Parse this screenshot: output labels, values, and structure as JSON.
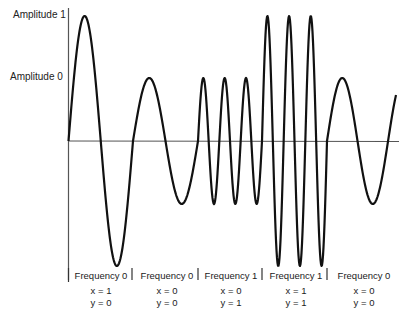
{
  "diagram": {
    "y_axis_labels": [
      {
        "text": "Amplitude 1",
        "x": 13,
        "y": 10
      },
      {
        "text": "Amplitude 0",
        "x": 10,
        "y": 72
      }
    ],
    "segments": [
      {
        "frequency_label": "Frequency 0",
        "x_label": "x = 1",
        "y_label": "y = 0",
        "frequency": 0,
        "amplitude": 1,
        "x_bit": 1,
        "y_bit": 0
      },
      {
        "frequency_label": "Frequency 0",
        "x_label": "x = 0",
        "y_label": "y = 0",
        "frequency": 0,
        "amplitude": 0,
        "x_bit": 0,
        "y_bit": 0
      },
      {
        "frequency_label": "Frequency 1",
        "x_label": "x = 0",
        "y_label": "y = 1",
        "frequency": 1,
        "amplitude": 0,
        "x_bit": 0,
        "y_bit": 1
      },
      {
        "frequency_label": "Frequency 1",
        "x_label": "x = 1",
        "y_label": "y = 1",
        "frequency": 1,
        "amplitude": 1,
        "x_bit": 1,
        "y_bit": 1
      },
      {
        "frequency_label": "Frequency 0",
        "x_label": "x = 0",
        "y_label": "y = 0",
        "frequency": 0,
        "amplitude": 0,
        "x_bit": 0,
        "y_bit": 0
      }
    ],
    "colors": {
      "waveform": "#111111",
      "axis": "#555555",
      "background": "#ffffff"
    }
  }
}
